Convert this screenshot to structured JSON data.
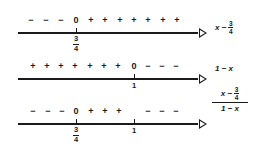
{
  "rows": [
    {
      "label": {
        "expr_prefix": "x −",
        "frac_num": "3",
        "frac_den": "4"
      },
      "signs": [
        "−",
        "−",
        "−",
        "0",
        "+",
        "+",
        "+",
        "+",
        "+",
        "+",
        "+"
      ],
      "ticks": [
        {
          "value_num": "3",
          "value_den": "4"
        }
      ]
    },
    {
      "label": {
        "expr": "1 − x"
      },
      "signs": [
        "+",
        "+",
        "+",
        "+",
        "+",
        "+",
        "+",
        "0",
        "−",
        "−",
        "−"
      ],
      "ticks": [
        {
          "value": "1"
        }
      ]
    },
    {
      "label": {
        "num_prefix": "x −",
        "num_frac_num": "3",
        "num_frac_den": "4",
        "den": "1 − x"
      },
      "signs": [
        "−",
        "−",
        "−",
        "0",
        "+",
        "+",
        "+",
        "",
        "−",
        "−",
        "−"
      ],
      "ticks": [
        {
          "value_num": "3",
          "value_den": "4"
        },
        {
          "value": "1"
        }
      ]
    }
  ]
}
